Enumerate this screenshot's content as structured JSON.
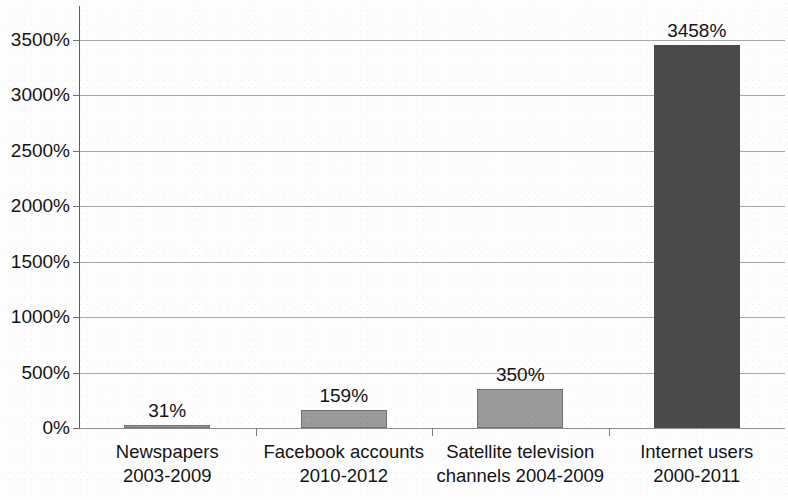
{
  "chart_data": {
    "type": "bar",
    "title": "",
    "subtitle": "",
    "xlabel": "",
    "ylabel": "",
    "ylim": [
      0,
      3700
    ],
    "grid": true,
    "legend": "none",
    "value_suffix": "%",
    "categories": [
      "Newspapers 2003-2009",
      "Facebook accounts 2010-2012",
      "Satellite television channels 2004-2009",
      "Internet users 2000-2011"
    ],
    "category_lines": [
      [
        "Newspapers",
        "2003-2009"
      ],
      [
        "Facebook accounts",
        "2010-2012"
      ],
      [
        "Satellite television",
        "channels 2004-2009"
      ],
      [
        "Internet users",
        "2000-2011"
      ]
    ],
    "values": [
      31,
      159,
      350,
      3458
    ],
    "value_labels": [
      "31%",
      "159%",
      "350%",
      "3458%"
    ],
    "bar_colors": [
      "#9a9a9a",
      "#9a9a9a",
      "#9a9a9a",
      "#4a4a4a"
    ],
    "yticks": [
      0,
      500,
      1000,
      1500,
      2000,
      2500,
      3000,
      3500
    ],
    "ytick_labels": [
      "0%",
      "500%",
      "1000%",
      "1500%",
      "2000%",
      "2500%",
      "3000%",
      "3500%"
    ],
    "colors": {
      "light_bar": "#9a9a9a",
      "dark_bar": "#4a4a4a",
      "gridline": "#a8a8a8",
      "axis": "#5a5a5a",
      "text": "#141414",
      "background": "#fdfdfd"
    }
  },
  "title_fragment": ""
}
